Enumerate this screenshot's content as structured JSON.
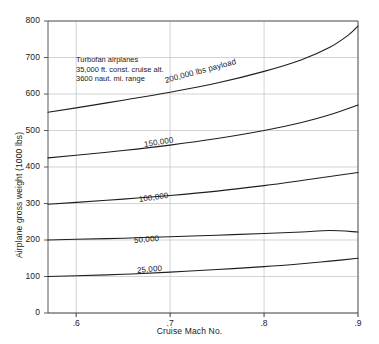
{
  "chart_data": {
    "type": "line",
    "title": "",
    "xlabel": "Cruise Mach No.",
    "ylabel": "Airplane gross weight (1000 lbs)",
    "xlim": [
      0.57,
      0.9
    ],
    "ylim": [
      0,
      800
    ],
    "xticks": [
      ".6",
      ".7",
      ".8",
      ".9"
    ],
    "xtick_values": [
      0.6,
      0.7,
      0.8,
      0.9
    ],
    "yticks": [
      "0",
      "100",
      "200",
      "300",
      "400",
      "500",
      "600",
      "700",
      "800"
    ],
    "ytick_values": [
      0,
      100,
      200,
      300,
      400,
      500,
      600,
      700,
      800
    ],
    "grid": true,
    "grid_color": "#c8c8c8",
    "axis_color": "#5a5a5a",
    "line_color": "#1e1e1e",
    "legend": "inline-curve-labels",
    "annotation": [
      "Turbofan airplanes",
      "35,000 ft. const. cruise alt.",
      "3600 naut. mi. range"
    ],
    "series": [
      {
        "name": "200,000 lbs payload",
        "label": "200,000 lbs payload",
        "label_x": 0.695,
        "label_y": 648,
        "label_rotation": -15,
        "points": [
          [
            0.57,
            550
          ],
          [
            0.6,
            562
          ],
          [
            0.65,
            583
          ],
          [
            0.7,
            605
          ],
          [
            0.75,
            630
          ],
          [
            0.8,
            662
          ],
          [
            0.84,
            694
          ],
          [
            0.87,
            728
          ],
          [
            0.89,
            762
          ],
          [
            0.9,
            786
          ]
        ]
      },
      {
        "name": "150,000",
        "label": "150,000",
        "label_x": 0.672,
        "label_y": 475,
        "label_rotation": -9,
        "points": [
          [
            0.57,
            425
          ],
          [
            0.6,
            432
          ],
          [
            0.65,
            445
          ],
          [
            0.7,
            460
          ],
          [
            0.75,
            478
          ],
          [
            0.8,
            500
          ],
          [
            0.84,
            522
          ],
          [
            0.87,
            543
          ],
          [
            0.9,
            570
          ]
        ]
      },
      {
        "name": "100,000",
        "label": "100,000",
        "label_x": 0.667,
        "label_y": 322,
        "label_rotation": -8,
        "points": [
          [
            0.57,
            298
          ],
          [
            0.6,
            303
          ],
          [
            0.65,
            312
          ],
          [
            0.7,
            322
          ],
          [
            0.75,
            334
          ],
          [
            0.8,
            349
          ],
          [
            0.84,
            363
          ],
          [
            0.87,
            374
          ],
          [
            0.9,
            385
          ]
        ]
      },
      {
        "name": "50,000",
        "label": "50,000",
        "label_x": 0.662,
        "label_y": 212,
        "label_rotation": -5,
        "points": [
          [
            0.57,
            200
          ],
          [
            0.6,
            202
          ],
          [
            0.65,
            205
          ],
          [
            0.7,
            209
          ],
          [
            0.75,
            213
          ],
          [
            0.8,
            218
          ],
          [
            0.84,
            222
          ],
          [
            0.87,
            226
          ],
          [
            0.9,
            222
          ]
        ]
      },
      {
        "name": "25,000",
        "label": "25,000",
        "label_x": 0.665,
        "label_y": 130,
        "label_rotation": -5,
        "points": [
          [
            0.57,
            100
          ],
          [
            0.6,
            102
          ],
          [
            0.65,
            106
          ],
          [
            0.7,
            112
          ],
          [
            0.75,
            119
          ],
          [
            0.8,
            127
          ],
          [
            0.84,
            135
          ],
          [
            0.87,
            142
          ],
          [
            0.9,
            150
          ]
        ]
      }
    ]
  }
}
